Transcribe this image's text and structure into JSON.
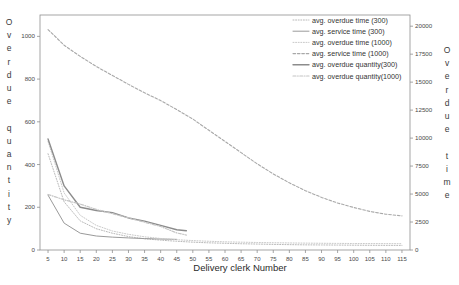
{
  "chart_data": {
    "type": "line",
    "title": "",
    "xlabel": "Delivery clerk Number",
    "ylabel_left": "Overdue quantity",
    "ylabel_right": "Overdue time",
    "grid": false,
    "legend_position": "top-right",
    "x": [
      5,
      10,
      15,
      20,
      25,
      30,
      35,
      40,
      45,
      50,
      55,
      60,
      65,
      70,
      75,
      80,
      85,
      90,
      95,
      100,
      105,
      110,
      115
    ],
    "xlim": [
      2.5,
      117.5
    ],
    "xticks": [
      5,
      10,
      15,
      20,
      25,
      30,
      35,
      40,
      45,
      50,
      55,
      60,
      65,
      70,
      75,
      80,
      85,
      90,
      95,
      100,
      105,
      110,
      115
    ],
    "left_axis": {
      "lim": [
        0,
        1100
      ],
      "ticks": [
        0,
        200,
        400,
        600,
        800,
        1000
      ],
      "ticklabels": [
        "0",
        "200",
        "400",
        "600",
        "800",
        "1000"
      ]
    },
    "right_axis": {
      "lim": [
        0,
        21000
      ],
      "ticks": [
        0,
        2500,
        5000,
        7500,
        10000,
        12500,
        15000,
        17500,
        20000
      ],
      "ticklabels": [
        "0",
        "2500",
        "5000",
        "7500",
        "10000",
        "12500",
        "15000",
        "17500",
        "20000"
      ]
    },
    "series": [
      {
        "name": "avg. overdue time (300)",
        "axis": "right",
        "style": "dotted",
        "color": "#b9b9b9",
        "width": 1.0,
        "x": [
          5,
          10,
          15,
          20,
          25,
          30,
          35,
          40,
          45,
          50,
          55,
          60,
          65,
          70,
          75,
          80,
          85,
          90,
          95,
          100,
          105,
          110,
          115
        ],
        "values": [
          8600,
          4300,
          2600,
          1900,
          1500,
          1200,
          1000,
          880,
          780,
          700,
          640,
          600,
          560,
          530,
          500,
          480,
          460,
          450,
          440,
          430,
          420,
          415,
          410
        ]
      },
      {
        "name": "avg. service time (300)",
        "axis": "right",
        "style": "solid",
        "color": "#9a9a9a",
        "width": 1.0,
        "x": [
          5,
          10,
          15,
          20,
          25,
          30,
          35,
          40,
          45
        ],
        "values": [
          4900,
          2400,
          1500,
          1250,
          1150,
          1080,
          1020,
          980,
          950
        ]
      },
      {
        "name": "avg. overdue time (1000)",
        "axis": "right",
        "style": "dotted",
        "color": "#c9c9c9",
        "width": 1.0,
        "x": [
          5,
          10,
          15,
          20,
          25,
          30,
          35,
          40,
          45,
          50,
          55,
          60,
          65,
          70,
          75,
          80,
          85,
          90,
          95,
          100,
          105,
          110,
          115
        ],
        "values": [
          9700,
          5100,
          3100,
          2200,
          1700,
          1400,
          1180,
          1030,
          920,
          840,
          780,
          730,
          700,
          670,
          650,
          630,
          615,
          600,
          590,
          580,
          575,
          570,
          565
        ]
      },
      {
        "name": "avg. service time (1000)",
        "axis": "right",
        "style": "dashed",
        "color": "#a8a8a8",
        "width": 1.1,
        "x": [
          5,
          10,
          15,
          20,
          25,
          30,
          35,
          40,
          45,
          50,
          55,
          60,
          65,
          70,
          75,
          80,
          85,
          90,
          95,
          100,
          105,
          110,
          115
        ],
        "values": [
          19700,
          18300,
          17300,
          16400,
          15600,
          14800,
          14050,
          13350,
          12550,
          11700,
          10700,
          9700,
          8700,
          7700,
          6800,
          6000,
          5300,
          4700,
          4200,
          3800,
          3450,
          3200,
          3050
        ]
      },
      {
        "name": "avg. overdue quantity(300)",
        "axis": "left",
        "style": "solid",
        "color": "#8c8c8c",
        "width": 1.4,
        "x": [
          5,
          10,
          15,
          20,
          25,
          30,
          35,
          40,
          45,
          48
        ],
        "values": [
          520,
          300,
          200,
          185,
          175,
          150,
          135,
          115,
          95,
          90
        ]
      },
      {
        "name": "avg. overdue quantity(1000)",
        "axis": "left",
        "style": "dashdot",
        "color": "#c4c4c4",
        "width": 1.2,
        "x": [
          5,
          10,
          15,
          20,
          25,
          30,
          35,
          40,
          45,
          48
        ],
        "values": [
          260,
          235,
          215,
          190,
          170,
          150,
          130,
          110,
          80,
          70
        ]
      }
    ]
  },
  "legend": {
    "items": [
      {
        "label": "avg. overdue time (300)",
        "style": "dotted"
      },
      {
        "label": "avg. service time (300)",
        "style": "solid"
      },
      {
        "label": "avg. overdue time (1000)",
        "style": "dotted"
      },
      {
        "label": "avg. service time (1000)",
        "style": "dashed"
      },
      {
        "label": "avg. overdue quantity(300)",
        "style": "solid"
      },
      {
        "label": "avg. overdue quantity(1000)",
        "style": "dashdot"
      }
    ]
  },
  "axis_titles": {
    "left": "Overdue quantity",
    "right": "Overdue time",
    "bottom": "Delivery clerk Number"
  },
  "colors": {
    "frame": "#8f8f8f",
    "text": "#3a3a3a",
    "background": "#ffffff"
  }
}
